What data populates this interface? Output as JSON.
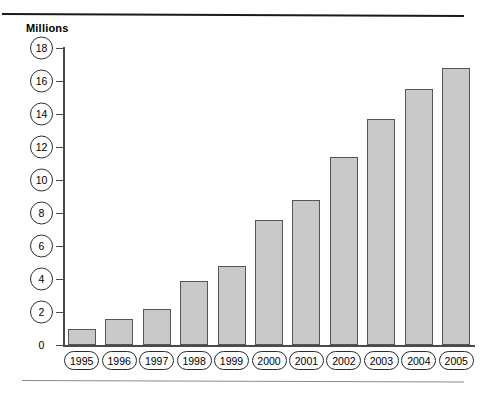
{
  "chart_data": {
    "type": "bar",
    "title": "Millions",
    "subtitle": "",
    "xlabel": "",
    "ylabel": "Millions",
    "categories": [
      "1995",
      "1996",
      "1997",
      "1998",
      "1999",
      "2000",
      "2001",
      "2002",
      "2003",
      "2004",
      "2005"
    ],
    "values": [
      1.0,
      1.6,
      2.2,
      3.9,
      4.8,
      7.6,
      8.8,
      11.4,
      13.7,
      15.5,
      16.8
    ],
    "ylim": [
      0,
      18
    ],
    "ytick_values": [
      0,
      2,
      4,
      6,
      8,
      10,
      12,
      14,
      16,
      18
    ],
    "ytick_labels": [
      "0",
      "2",
      "4",
      "6",
      "8",
      "10",
      "12",
      "14",
      "16",
      "18"
    ],
    "grid": false,
    "legend": null,
    "legend_position": "none",
    "bar_fill_color": "#c9c9c9",
    "bar_border_color": "#555555",
    "axis_color": "#4a4a4a",
    "text_color": "#000000"
  },
  "decorations": {
    "top_rule": "horizontal-rule-thick",
    "bottom_rule": "horizontal-rule-thin"
  }
}
